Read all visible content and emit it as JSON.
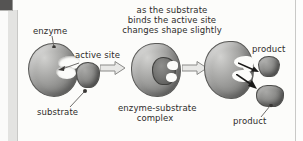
{
  "figure": {
    "name": "enzyme-substrate-reaction-diagram",
    "header_caption": {
      "line1": "as the substrate",
      "line2": "binds the active site",
      "line3": "changes shape slightly"
    },
    "labels": {
      "enzyme": "enzyme",
      "active_site": "active site",
      "substrate": "substrate",
      "complex_line1": "enzyme-substrate",
      "complex_line2": "complex",
      "product_top": "product",
      "product_bottom": "product"
    },
    "stages": [
      {
        "id": "stage-1",
        "caption": "substrate"
      },
      {
        "id": "stage-2",
        "caption": "enzyme-substrate complex"
      },
      {
        "id": "stage-3",
        "caption": "product"
      }
    ],
    "colors": {
      "page_background": "#fdfdfc",
      "enzyme_fill": "#8c8c8a",
      "substrate_fill": "#6e6e6c",
      "text": "#2e2c2b",
      "arrow_outline": "#8a8a88",
      "release_arrow": "#1b1a19",
      "scan_strip": "#e3e3e1"
    }
  }
}
